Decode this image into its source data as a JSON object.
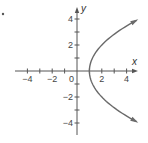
{
  "chart_data": {
    "type": "line",
    "title": "",
    "xlabel": "x",
    "ylabel": "y",
    "xlim": [
      -5,
      5
    ],
    "ylim": [
      -5,
      5
    ],
    "grid": false,
    "x_ticks": [
      -4,
      -3,
      -2,
      -1,
      1,
      2,
      3,
      4
    ],
    "y_ticks": [
      -4,
      -3,
      -2,
      -1,
      1,
      2,
      3,
      4
    ],
    "x_tick_labels": [
      {
        "value": -4,
        "label": "−4"
      },
      {
        "value": -2,
        "label": "−2"
      },
      {
        "value": 2,
        "label": "2"
      },
      {
        "value": 4,
        "label": "4"
      }
    ],
    "y_tick_labels": [
      {
        "value": 4,
        "label": "4"
      },
      {
        "value": 2,
        "label": "2"
      },
      {
        "value": -2,
        "label": "−2"
      },
      {
        "value": -4,
        "label": "−4"
      }
    ],
    "origin_label": "0",
    "series": [
      {
        "name": "parabola x = 1 + y²/4",
        "description": "Parabola opening to the right, vertex at (1, 0), arrows at both ends",
        "equation": "x = 1 + y^2/4",
        "vertex": [
          1,
          0
        ],
        "y_range": [
          -3.9,
          3.9
        ],
        "points": [
          [
            4.8,
            -3.9
          ],
          [
            4.06,
            -3.5
          ],
          [
            3.25,
            -3
          ],
          [
            2.56,
            -2.5
          ],
          [
            2,
            -2
          ],
          [
            1.56,
            -1.5
          ],
          [
            1.25,
            -1
          ],
          [
            1.06,
            -0.5
          ],
          [
            1,
            0
          ],
          [
            1.06,
            0.5
          ],
          [
            1.25,
            1
          ],
          [
            1.56,
            1.5
          ],
          [
            2,
            2
          ],
          [
            2.56,
            2.5
          ],
          [
            3.25,
            3
          ],
          [
            4.06,
            3.5
          ],
          [
            4.8,
            3.9
          ]
        ],
        "color": "#6a6a6a"
      }
    ]
  },
  "layout": {
    "origin_px": [
      77,
      71
    ],
    "unit_px_x": 12.4,
    "unit_px_y": 13,
    "x_axis_px": [
      15,
      138
    ],
    "y_axis_px": [
      7,
      135
    ]
  },
  "colors": {
    "axis": "#555555",
    "curve": "#6a6a6a",
    "text": "#444444",
    "background": "#ffffff"
  }
}
